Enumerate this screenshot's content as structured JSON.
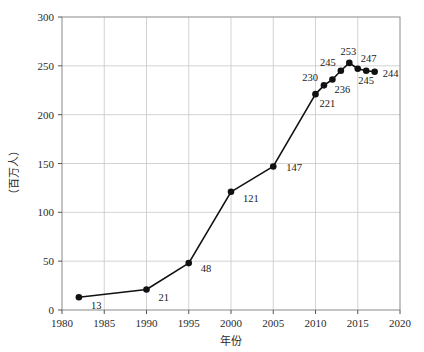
{
  "chart_data": {
    "type": "line",
    "title": "",
    "xlabel": "年份",
    "ylabel": "（百万人）",
    "xlim": [
      1980,
      2020
    ],
    "ylim": [
      0,
      300
    ],
    "xticks": [
      1980,
      1985,
      1990,
      1995,
      2000,
      2005,
      2010,
      2015,
      2020
    ],
    "yticks": [
      0,
      50,
      100,
      150,
      200,
      250,
      300
    ],
    "grid": true,
    "legend": "none",
    "marker": "filled-circle",
    "line_color": "#111111",
    "grid_color": "#c8c8c8",
    "frame_color": "#8a8a8a",
    "x": [
      1982,
      1990,
      1995,
      2000,
      2005,
      2010,
      2011,
      2012,
      2013,
      2014,
      2015,
      2016,
      2017
    ],
    "values": [
      13,
      21,
      48,
      121,
      147,
      221,
      230,
      236,
      245,
      253,
      247,
      245,
      244
    ],
    "point_labels": [
      "13",
      "21",
      "48",
      "121",
      "147",
      "221",
      "230",
      "236",
      "245",
      "253",
      "247",
      "245",
      "244"
    ],
    "label_offsets": [
      {
        "dx": 12,
        "dy": 12,
        "anchor": "start"
      },
      {
        "dx": 12,
        "dy": 12,
        "anchor": "start"
      },
      {
        "dx": 12,
        "dy": 9,
        "anchor": "start"
      },
      {
        "dx": 12,
        "dy": 10,
        "anchor": "start"
      },
      {
        "dx": 13,
        "dy": 5,
        "anchor": "start"
      },
      {
        "dx": 4,
        "dy": 13,
        "anchor": "start"
      },
      {
        "dx": -6,
        "dy": -4,
        "anchor": "end"
      },
      {
        "dx": 2,
        "dy": 13,
        "anchor": "start"
      },
      {
        "dx": -5,
        "dy": -5,
        "anchor": "end"
      },
      {
        "dx": -1,
        "dy": -8,
        "anchor": "middle"
      },
      {
        "dx": 3,
        "dy": -7,
        "anchor": "start"
      },
      {
        "dx": 0,
        "dy": 13,
        "anchor": "middle"
      },
      {
        "dx": 8,
        "dy": 5,
        "anchor": "start"
      }
    ]
  },
  "ticks": {
    "y": [
      "300",
      "250",
      "200",
      "150",
      "100",
      "50",
      "0"
    ],
    "x": [
      "1980",
      "1985",
      "1990",
      "1995",
      "2000",
      "2005",
      "2010",
      "2015",
      "2020"
    ]
  },
  "axes": {
    "x_title": "年份",
    "y_title": "（百万人）"
  }
}
